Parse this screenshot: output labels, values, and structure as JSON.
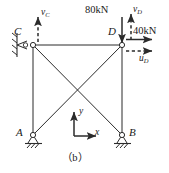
{
  "figure": {
    "caption": "（b）",
    "type": "truss-structure-diagram",
    "colors": {
      "line": "#2b2b2b",
      "text": "#1a1a1a",
      "node_fill": "#ffffff",
      "background": "#ffffff"
    }
  },
  "nodes": [
    {
      "id": "C",
      "label": "C",
      "x": 33,
      "y": 45,
      "label_x": 14,
      "label_y": 26
    },
    {
      "id": "D",
      "label": "D",
      "x": 122,
      "y": 45,
      "label_x": 108,
      "label_y": 26
    },
    {
      "id": "A",
      "label": "A",
      "x": 33,
      "y": 135,
      "label_x": 16,
      "label_y": 127
    },
    {
      "id": "B",
      "label": "B",
      "x": 122,
      "y": 135,
      "label_x": 129,
      "label_y": 127
    }
  ],
  "members": [
    {
      "name": "top-chord-CD",
      "from": "C",
      "to": "D"
    },
    {
      "name": "left-chord-CA",
      "from": "C",
      "to": "A"
    },
    {
      "name": "right-chord-DB",
      "from": "D",
      "to": "B"
    },
    {
      "name": "diagonal-CB",
      "from": "C",
      "to": "B"
    },
    {
      "name": "diagonal-AD",
      "from": "A",
      "to": "D"
    }
  ],
  "supports": [
    {
      "name": "support-C",
      "node": "C",
      "kind": "roller-vertical-wall"
    },
    {
      "name": "support-A",
      "node": "A",
      "kind": "pinned-ground"
    },
    {
      "name": "support-B",
      "node": "B",
      "kind": "pinned-ground"
    }
  ],
  "loads": [
    {
      "name": "load-vertical-at-D",
      "label": "80kN",
      "magnitude": 80,
      "unit": "kN",
      "direction": "down",
      "at": "D",
      "label_x": 85,
      "label_y": 6
    },
    {
      "name": "load-horizontal-at-D",
      "label": "40kN",
      "magnitude": 40,
      "unit": "kN",
      "direction": "right",
      "at": "D",
      "label_x": 133,
      "label_y": 27
    }
  ],
  "dof_arrows": [
    {
      "name": "dof-vC",
      "symbol": "v",
      "subscript": "C",
      "at": "C",
      "direction": "up",
      "label_x": 41,
      "label_y": 9
    },
    {
      "name": "dof-vD",
      "symbol": "v",
      "subscript": "D",
      "at": "D",
      "direction": "up",
      "label_x": 131,
      "label_y": 6
    },
    {
      "name": "dof-uD",
      "symbol": "u",
      "subscript": "D",
      "at": "D",
      "direction": "right",
      "label_x": 139,
      "label_y": 52
    }
  ],
  "axes": {
    "name": "coordinate-axes",
    "origin_x": 74,
    "origin_y": 136,
    "y_label": "y",
    "y_label_x": 83,
    "y_label_y": 108,
    "x_label": "x",
    "x_label_x": 96,
    "x_label_y": 130
  },
  "caption_pos": {
    "x": 62,
    "y": 154
  }
}
